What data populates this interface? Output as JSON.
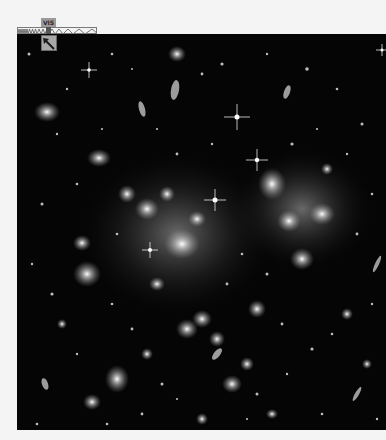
{
  "spectrum": {
    "band_label": "VIS",
    "band_color": "#9a9a9a",
    "icon": "spectrum-wave-icon"
  },
  "orientation": {
    "icon": "orientation-arrow-icon",
    "color": "#1a1a1a"
  },
  "image": {
    "subject": "galaxy cluster deep field",
    "background_color": "#050505"
  }
}
